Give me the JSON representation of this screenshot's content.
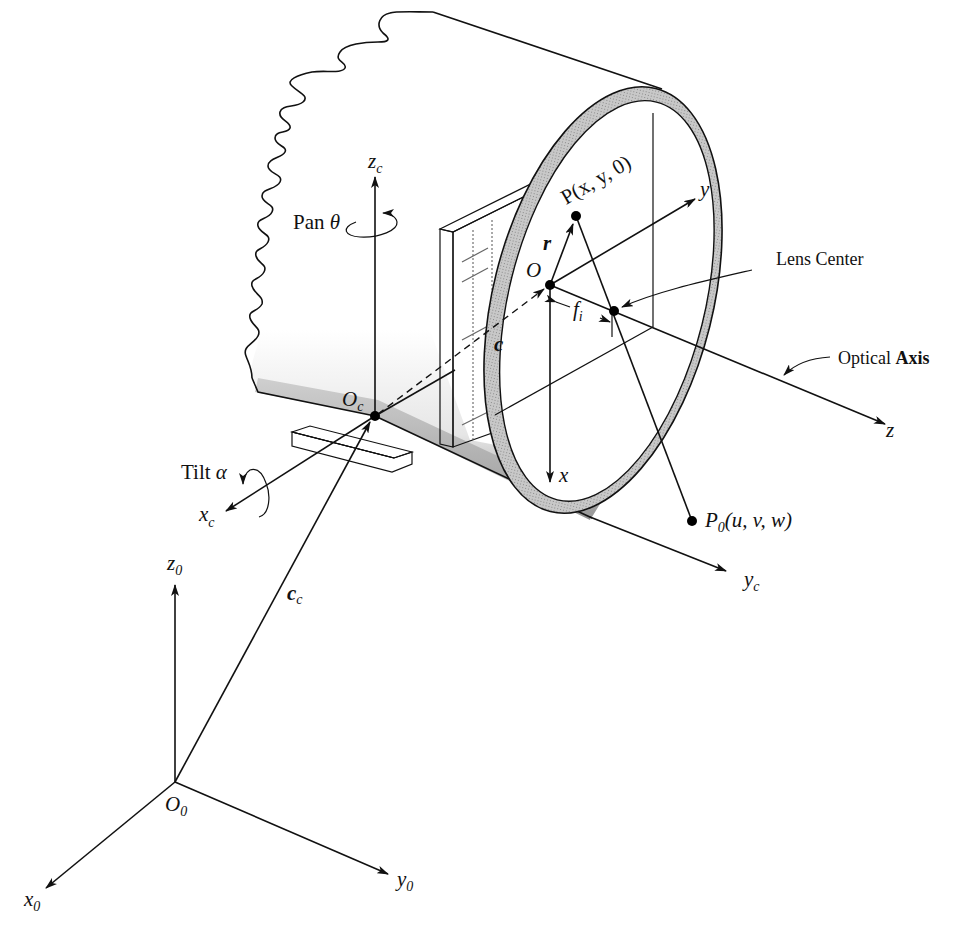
{
  "figure": {
    "colors": {
      "ink": "#111111",
      "shade": "#b8b8b8",
      "background": "#ffffff"
    }
  },
  "labels": {
    "zc": {
      "main": "z",
      "sub": "c"
    },
    "pan": {
      "text": "Pan ",
      "symbol": "θ"
    },
    "P": "P(x, y, 0)",
    "y_axis": "y",
    "r_vec": "r",
    "O": "O",
    "lens_center": "Lens Center",
    "fi": {
      "main": "f",
      "sub": "i"
    },
    "c_vec": "c",
    "optical_axis": {
      "word1": "Optical ",
      "word2": "Axis"
    },
    "z_axis": "z",
    "Oc": {
      "main": "O",
      "sub": "c"
    },
    "tilt": {
      "text": "Tilt ",
      "symbol": "α"
    },
    "xc": {
      "main": "x",
      "sub": "c"
    },
    "x_axis": "x",
    "P0": {
      "main": "P",
      "sub": "0",
      "args": "(u, v, w)"
    },
    "yc": {
      "main": "y",
      "sub": "c"
    },
    "z0": {
      "main": "z",
      "sub": "0"
    },
    "cc": {
      "main": "c",
      "sub": "c"
    },
    "O0": {
      "main": "O",
      "sub": "0"
    },
    "x0": {
      "main": "x",
      "sub": "0"
    },
    "y0": {
      "main": "y",
      "sub": "0"
    }
  },
  "points": {
    "O": [
      550,
      285
    ],
    "P": [
      576,
      216
    ],
    "lens_center": [
      614,
      311
    ],
    "Oc": [
      375,
      416
    ],
    "P0": [
      692,
      521
    ],
    "O0": [
      175,
      782
    ]
  }
}
